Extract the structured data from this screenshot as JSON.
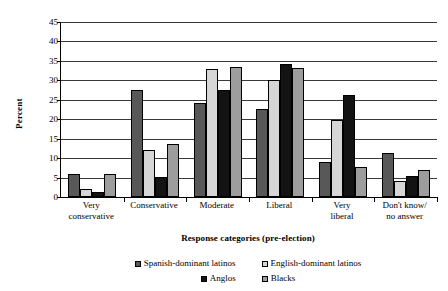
{
  "chart_data": {
    "type": "bar",
    "title": "",
    "xlabel": "Response categories (pre-election)",
    "ylabel": "Percent",
    "ylim": [
      0,
      45
    ],
    "ytick_step": 5,
    "yticks": [
      "45",
      "40",
      "35",
      "30",
      "25",
      "20",
      "15",
      "10",
      "5",
      "0"
    ],
    "grid": "horizontal",
    "legend_position": "bottom",
    "categories": [
      "Very\nconservative",
      "Conservative",
      "Moderate",
      "Liberal",
      "Very\nliberal",
      "Don't know/\nno answer"
    ],
    "category_lines": [
      [
        "Very",
        "conservative"
      ],
      [
        "Conservative",
        ""
      ],
      [
        "Moderate",
        ""
      ],
      [
        "Liberal",
        ""
      ],
      [
        "Very",
        "liberal"
      ],
      [
        "Don't know/",
        "no answer"
      ]
    ],
    "series": [
      {
        "name": "Spanish-dominant latinos",
        "color": "#585858",
        "values": [
          5.8,
          27.4,
          24.1,
          22.6,
          9.1,
          11.2
        ]
      },
      {
        "name": "English-dominant latinos",
        "color": "#d6d6d6",
        "values": [
          2.0,
          12.0,
          32.9,
          30.2,
          19.8,
          4.2
        ]
      },
      {
        "name": "Anglos",
        "color": "#131313",
        "values": [
          1.4,
          5.1,
          27.6,
          34.3,
          26.2,
          5.5
        ]
      },
      {
        "name": "Blacks",
        "color": "#9d9d9d",
        "values": [
          5.9,
          13.6,
          33.4,
          33.2,
          7.8,
          7.0
        ]
      }
    ]
  }
}
